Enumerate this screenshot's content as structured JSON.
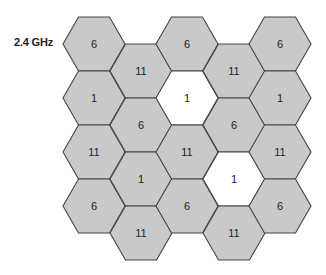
{
  "diagram": {
    "band_label": "2.4 GHz",
    "colors": {
      "cell_fill": "#c9c9c9",
      "highlight_fill": "#ffffff",
      "stroke": "#444444",
      "text": "#222222"
    },
    "cells": [
      {
        "col": 0,
        "row": 0,
        "cx": 94,
        "cy": 44,
        "channel": "6",
        "highlight": false
      },
      {
        "col": 0,
        "row": 1,
        "cx": 94,
        "cy": 98,
        "channel": "1",
        "highlight": false
      },
      {
        "col": 0,
        "row": 2,
        "cx": 94,
        "cy": 152,
        "channel": "11",
        "highlight": false
      },
      {
        "col": 0,
        "row": 3,
        "cx": 94,
        "cy": 206,
        "channel": "6",
        "highlight": false
      },
      {
        "col": 1,
        "row": 0,
        "cx": 141,
        "cy": 71,
        "channel": "11",
        "highlight": false
      },
      {
        "col": 1,
        "row": 1,
        "cx": 141,
        "cy": 125,
        "channel": "6",
        "highlight": false
      },
      {
        "col": 1,
        "row": 2,
        "cx": 141,
        "cy": 179,
        "channel": "1",
        "highlight": false
      },
      {
        "col": 1,
        "row": 3,
        "cx": 141,
        "cy": 233,
        "channel": "11",
        "highlight": false
      },
      {
        "col": 2,
        "row": 0,
        "cx": 187,
        "cy": 44,
        "channel": "6",
        "highlight": false
      },
      {
        "col": 2,
        "row": 1,
        "cx": 187,
        "cy": 98,
        "channel": "1",
        "highlight": true
      },
      {
        "col": 2,
        "row": 2,
        "cx": 187,
        "cy": 152,
        "channel": "11",
        "highlight": false
      },
      {
        "col": 2,
        "row": 3,
        "cx": 187,
        "cy": 206,
        "channel": "6",
        "highlight": false
      },
      {
        "col": 3,
        "row": 0,
        "cx": 234,
        "cy": 71,
        "channel": "11",
        "highlight": false
      },
      {
        "col": 3,
        "row": 1,
        "cx": 234,
        "cy": 125,
        "channel": "6",
        "highlight": false
      },
      {
        "col": 3,
        "row": 2,
        "cx": 234,
        "cy": 179,
        "channel": "1",
        "highlight": true
      },
      {
        "col": 3,
        "row": 3,
        "cx": 234,
        "cy": 233,
        "channel": "11",
        "highlight": false
      },
      {
        "col": 4,
        "row": 0,
        "cx": 280,
        "cy": 44,
        "channel": "6",
        "highlight": false
      },
      {
        "col": 4,
        "row": 1,
        "cx": 280,
        "cy": 98,
        "channel": "1",
        "highlight": false
      },
      {
        "col": 4,
        "row": 2,
        "cx": 280,
        "cy": 152,
        "channel": "11",
        "highlight": false
      },
      {
        "col": 4,
        "row": 3,
        "cx": 280,
        "cy": 206,
        "channel": "6",
        "highlight": false
      }
    ]
  }
}
